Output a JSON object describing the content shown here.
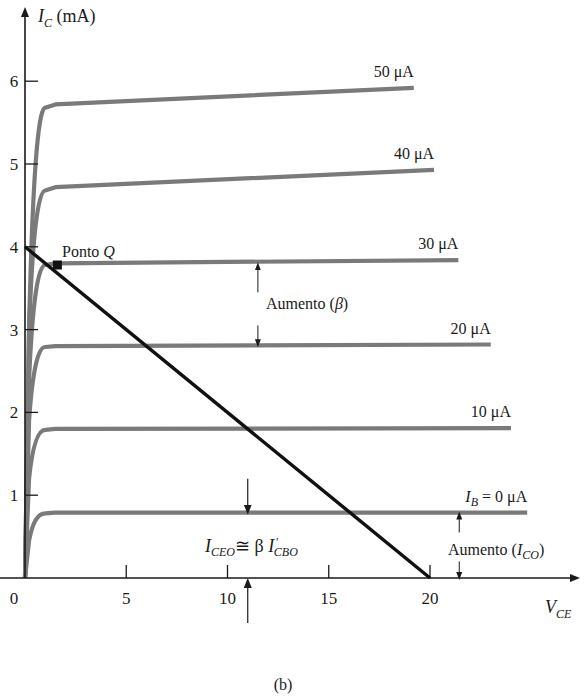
{
  "chart_data": {
    "type": "line",
    "title": "",
    "caption": "(b)",
    "xlabel": "V_CE",
    "xlabel_main": "V",
    "xlabel_sub": "CE",
    "ylabel": "I_C (mA)",
    "ylabel_main": "I",
    "ylabel_sub": "C",
    "ylabel_unit": " (mA)",
    "xlim": [
      0,
      25
    ],
    "ylim": [
      0,
      7
    ],
    "x_ticks": [
      0,
      5,
      10,
      15,
      20
    ],
    "x_tick_labels": [
      "0",
      "5",
      "10",
      "15",
      "20"
    ],
    "y_ticks": [
      1,
      2,
      3,
      4,
      5,
      6
    ],
    "y_tick_labels": [
      "1",
      "2",
      "3",
      "4",
      "5",
      "6"
    ],
    "grid": false,
    "curve_color": "#7a7a7a",
    "load_line_color": "#111111",
    "series": [
      {
        "name": "50 μA",
        "label": "50 μA",
        "ib_uA": 50,
        "x": [
          0,
          0.2,
          0.5,
          1.0,
          1.5,
          19.2
        ],
        "y": [
          0,
          3.0,
          5.4,
          5.68,
          5.72,
          5.92
        ]
      },
      {
        "name": "40 μA",
        "label": "40 μA",
        "ib_uA": 40,
        "x": [
          0,
          0.2,
          0.5,
          1.0,
          1.5,
          20.2
        ],
        "y": [
          0,
          3.0,
          4.5,
          4.68,
          4.72,
          4.93
        ]
      },
      {
        "name": "30 μA",
        "label": "30 μA",
        "ib_uA": 30,
        "x": [
          0,
          0.2,
          0.5,
          1.0,
          1.5,
          21.4
        ],
        "y": [
          0,
          2.4,
          3.65,
          3.78,
          3.8,
          3.84
        ]
      },
      {
        "name": "20 μA",
        "label": "20 μA",
        "ib_uA": 20,
        "x": [
          0,
          0.2,
          0.5,
          1.0,
          1.5,
          23.0
        ],
        "y": [
          0,
          1.9,
          2.68,
          2.79,
          2.8,
          2.82
        ]
      },
      {
        "name": "10 μA",
        "label": "10 μA",
        "ib_uA": 10,
        "x": [
          0,
          0.2,
          0.5,
          1.0,
          1.5,
          24.0
        ],
        "y": [
          0,
          1.2,
          1.7,
          1.79,
          1.8,
          1.81
        ]
      },
      {
        "name": "I_B = 0 μA",
        "label_main": "I",
        "label_sub": "B",
        "label_rest": " = 0 μA",
        "ib_uA": 0,
        "x": [
          0,
          0.2,
          0.5,
          1.0,
          1.5,
          24.8
        ],
        "y": [
          0,
          0.45,
          0.72,
          0.78,
          0.79,
          0.79
        ]
      }
    ],
    "load_line": {
      "x": [
        0,
        20
      ],
      "y": [
        4,
        0
      ]
    },
    "q_point": {
      "label_main": "Ponto ",
      "label_ital": "Q",
      "x": 1.6,
      "y": 3.78
    },
    "annotations": {
      "beta": {
        "text_main": "Aumento (",
        "text_sym": "β",
        "text_end": ")",
        "x": 11.5,
        "y_from": 2.8,
        "y_to": 3.8
      },
      "ico": {
        "text_main": "Aumento (",
        "text_ital": "I",
        "text_sub": "CO",
        "text_end": ")",
        "x": 21.0,
        "y_from": 0,
        "y_to": 0.79
      },
      "iceo": {
        "lhs_main": "I",
        "lhs_sub": "CEO",
        "op": "≅ β ",
        "rhs_main": "I",
        "rhs_sub": "CBO",
        "rhs_prime": "′",
        "x": 11.0,
        "y_top": 0.79,
        "y_bottom": 0
      }
    }
  }
}
